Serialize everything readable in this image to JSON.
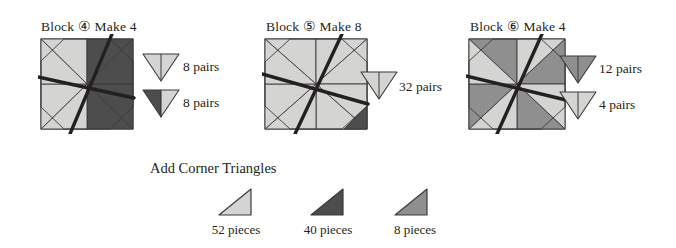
{
  "palette": {
    "light": "#d4d4d2",
    "medium": "#8f8f8f",
    "dark": "#4d4d4d",
    "outline": "#3c3a39",
    "marking_line": "#241f20",
    "background": "#ffffff",
    "text": "#231f20"
  },
  "blocks": [
    {
      "title": "Block ④ Make 4",
      "name": "block-4",
      "wedges": [
        "light",
        "light",
        "dark",
        "dark",
        "dark",
        "dark",
        "light",
        "light"
      ],
      "corner_triangles": [],
      "pairs": [
        {
          "count_label": "8  pairs",
          "left_shade": "light",
          "right_shade": "light"
        },
        {
          "count_label": "8 pairs",
          "left_shade": "dark",
          "right_shade": "light"
        }
      ]
    },
    {
      "title": "Block ⑤ Make 8",
      "name": "block-5",
      "wedges": [
        "light",
        "light",
        "light",
        "light",
        "light",
        "light",
        "light",
        "light"
      ],
      "corner_triangles": [
        {
          "position": "bottom-right",
          "shade": "dark"
        }
      ],
      "pairs": [
        {
          "count_label": "32  pairs",
          "left_shade": "light",
          "right_shade": "light"
        }
      ]
    },
    {
      "title": "Block ⑥ Make 4",
      "name": "block-6",
      "wedges": [
        "medium",
        "light",
        "medium",
        "light",
        "medium",
        "light",
        "medium",
        "light"
      ],
      "corner_triangles": [],
      "pairs": [
        {
          "count_label": "12 pairs",
          "left_shade": "medium",
          "right_shade": "medium"
        },
        {
          "count_label": "4  pairs",
          "left_shade": "light",
          "right_shade": "light"
        }
      ]
    }
  ],
  "footer": {
    "heading": "Add Corner Triangles",
    "triangles": [
      {
        "shade": "light",
        "label": "52 pieces"
      },
      {
        "shade": "dark",
        "label": "40 pieces"
      },
      {
        "shade": "medium",
        "label": "8 pieces"
      }
    ]
  }
}
